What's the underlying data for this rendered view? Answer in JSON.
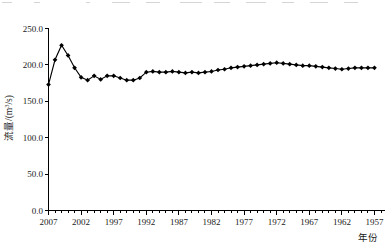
{
  "figure": {
    "background_color": "#ffffff",
    "line_color": "#000000",
    "marker_shape": "diamond"
  },
  "axes": {
    "y_title": "流量/(m³/s)",
    "y_title_parts": {
      "main": "流量/(m",
      "sup": "3",
      "tail": "/s)"
    },
    "x_title": "年份",
    "y_ticks": [
      "0.0",
      "50.0",
      "100.0",
      "150.0",
      "200.0",
      "250.0"
    ],
    "x_ticks": [
      "2007",
      "2002",
      "1997",
      "1992",
      "1987",
      "1982",
      "1977",
      "1972",
      "1967",
      "1962",
      "1957"
    ]
  },
  "chart_data": {
    "type": "line",
    "title": "",
    "xlabel": "年份",
    "ylabel": "流量/(m³/s)",
    "ylim": [
      0,
      250
    ],
    "xlim": [
      2007,
      1956
    ],
    "x_reversed": true,
    "grid": false,
    "legend": null,
    "ytick_values": [
      0,
      50,
      100,
      150,
      200,
      250
    ],
    "xtick_values": [
      2007,
      2002,
      1997,
      1992,
      1987,
      1982,
      1977,
      1972,
      1967,
      1962,
      1957
    ],
    "series": [
      {
        "name": "流量",
        "x": [
          2007,
          2006,
          2005,
          2004,
          2003,
          2002,
          2001,
          2000,
          1999,
          1998,
          1997,
          1996,
          1995,
          1994,
          1993,
          1992,
          1991,
          1990,
          1989,
          1988,
          1987,
          1986,
          1985,
          1984,
          1983,
          1982,
          1981,
          1980,
          1979,
          1978,
          1977,
          1976,
          1975,
          1974,
          1973,
          1972,
          1971,
          1970,
          1969,
          1968,
          1967,
          1966,
          1965,
          1964,
          1963,
          1962,
          1961,
          1960,
          1959,
          1958,
          1957
        ],
        "y": [
          173.0,
          207.0,
          227.0,
          213.0,
          196.0,
          183.0,
          179.0,
          185.0,
          180.0,
          185.0,
          185.0,
          182.0,
          179.0,
          179.0,
          182.0,
          190.0,
          191.0,
          190.0,
          190.0,
          191.0,
          190.0,
          189.0,
          190.0,
          189.0,
          190.0,
          191.0,
          193.0,
          194.0,
          196.0,
          197.0,
          198.0,
          199.0,
          200.0,
          201.0,
          202.0,
          203.0,
          202.0,
          201.0,
          200.0,
          199.0,
          199.0,
          198.0,
          197.0,
          196.0,
          195.0,
          194.0,
          195.0,
          196.0,
          196.0,
          196.0,
          196.0
        ]
      }
    ]
  }
}
